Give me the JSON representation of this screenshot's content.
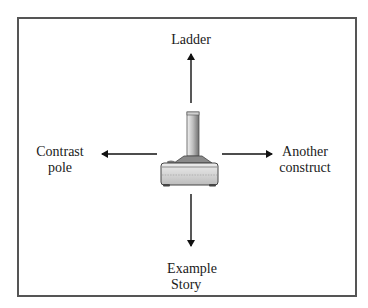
{
  "diagram": {
    "type": "laddering-construct-diagram",
    "center_image": "joystick-icon",
    "labels": {
      "top": "Ladder",
      "left_line1": "Contrast",
      "left_line2": "pole",
      "right_line1": "Another",
      "right_line2": "construct",
      "bottom_line1": "Example",
      "bottom_line2": "Story"
    },
    "arrows": [
      {
        "direction": "up",
        "target": "Ladder"
      },
      {
        "direction": "left",
        "target": "Contrast pole"
      },
      {
        "direction": "right",
        "target": "Another construct"
      },
      {
        "direction": "down",
        "target": "Example Story"
      }
    ],
    "colors": {
      "border": "#555555",
      "arrow": "#111111",
      "text": "#1a1a1a"
    }
  }
}
